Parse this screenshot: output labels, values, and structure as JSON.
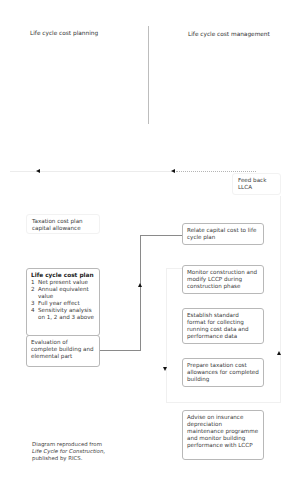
{
  "headings": {
    "left": "Life cycle cost planning",
    "right": "Life cycle cost management"
  },
  "feedback_box": {
    "line1": "Feed back",
    "line2": "LLCA"
  },
  "left_column": {
    "taxation_box": {
      "line1": "Taxation cost plan",
      "line2": "capital allowance"
    },
    "lccp_box": {
      "title": "Life cycle cost plan",
      "items": [
        {
          "num": "1",
          "text": "Net present value"
        },
        {
          "num": "2",
          "text": "Annual equivalent value"
        },
        {
          "num": "3",
          "text": "Full year effect"
        },
        {
          "num": "4",
          "text": "Sensitivity analysis on 1, 2 and 3 above"
        }
      ]
    },
    "evaluation_box": {
      "text": "Evaluation of complete building and elemental part"
    }
  },
  "right_column": {
    "steps": [
      {
        "text": "Relate capital cost to life cycle plan"
      },
      {
        "text": "Monitor construction and modify LCCP during construction phase"
      },
      {
        "text": "Establish standard format for collecting running cost data and performance data"
      },
      {
        "text": "Prepare taxation cost allowances for completed building"
      },
      {
        "text": "Advise on insurance depreciation maintenance programme and monitor building performance with LCCP"
      }
    ]
  },
  "caption": {
    "line1": "Diagram reproduced from",
    "title": "Life Cycle for Construction",
    "suffix": ",",
    "line3": "published by RICS."
  },
  "icons": {
    "arrow_left": "arrow-left-icon",
    "arrow_up": "arrow-up-icon",
    "arrow_down": "arrow-down-icon"
  },
  "colors": {
    "divider": "#bdbdbd",
    "box_border": "#b8b8b8",
    "text": "#3a3a3a"
  }
}
